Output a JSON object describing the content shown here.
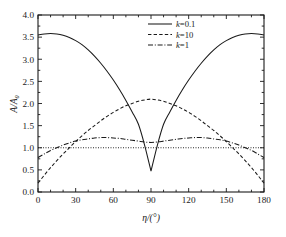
{
  "chart_data": {
    "type": "line",
    "title": "",
    "xlabel": "η/(°)",
    "ylabel": "A/A₀",
    "xlim": [
      0,
      180
    ],
    "ylim": [
      0,
      4
    ],
    "grid": false,
    "legend_position": "top-center",
    "x_ticks": [
      "0",
      "30",
      "60",
      "90",
      "120",
      "150",
      "180"
    ],
    "x_tick_values": [
      0,
      30,
      60,
      90,
      120,
      150,
      180
    ],
    "y_ticks": [
      "0.0",
      "0.5",
      "1.0",
      "1.5",
      "2.0",
      "2.5",
      "3.0",
      "3.5",
      "4.0"
    ],
    "y_tick_values": [
      0.0,
      0.5,
      1.0,
      1.5,
      2.0,
      2.5,
      3.0,
      3.5,
      4.0
    ],
    "x": [
      0,
      5,
      10,
      15,
      20,
      25,
      30,
      35,
      40,
      45,
      50,
      55,
      60,
      65,
      70,
      75,
      80,
      85,
      90,
      95,
      100,
      105,
      110,
      115,
      120,
      125,
      130,
      135,
      140,
      145,
      150,
      155,
      160,
      165,
      170,
      175,
      180
    ],
    "series": [
      {
        "name": "k=0.1",
        "k_value": 0.1,
        "style": "solid",
        "values": [
          3.55,
          3.57,
          3.58,
          3.57,
          3.54,
          3.49,
          3.42,
          3.33,
          3.21,
          3.07,
          2.91,
          2.73,
          2.53,
          2.31,
          2.07,
          1.81,
          1.53,
          1.05,
          0.47,
          1.05,
          1.53,
          1.81,
          2.07,
          2.31,
          2.53,
          2.73,
          2.91,
          3.07,
          3.21,
          3.33,
          3.42,
          3.49,
          3.54,
          3.57,
          3.58,
          3.57,
          3.55
        ]
      },
      {
        "name": "k=10",
        "k_value": 10,
        "style": "dashed",
        "values": [
          0.2,
          0.38,
          0.55,
          0.71,
          0.86,
          1.0,
          1.14,
          1.27,
          1.39,
          1.5,
          1.61,
          1.71,
          1.8,
          1.88,
          1.95,
          2.0,
          2.05,
          2.08,
          2.1,
          2.08,
          2.05,
          2.0,
          1.95,
          1.88,
          1.8,
          1.71,
          1.61,
          1.5,
          1.39,
          1.27,
          1.14,
          1.0,
          0.86,
          0.71,
          0.55,
          0.38,
          0.2
        ]
      },
      {
        "name": "k=1",
        "k_value": 1,
        "style": "dashdot",
        "values": [
          0.78,
          0.86,
          0.94,
          1.0,
          1.06,
          1.11,
          1.15,
          1.18,
          1.2,
          1.22,
          1.23,
          1.23,
          1.22,
          1.21,
          1.19,
          1.17,
          1.15,
          1.13,
          1.12,
          1.13,
          1.15,
          1.17,
          1.19,
          1.21,
          1.22,
          1.23,
          1.23,
          1.22,
          1.2,
          1.18,
          1.15,
          1.11,
          1.06,
          1.0,
          0.94,
          0.86,
          0.78
        ]
      },
      {
        "name": "reference",
        "style": "dotted",
        "constant": 1.0,
        "values": [
          1,
          1,
          1,
          1,
          1,
          1,
          1,
          1,
          1,
          1,
          1,
          1,
          1,
          1,
          1,
          1,
          1,
          1,
          1,
          1,
          1,
          1,
          1,
          1,
          1,
          1,
          1,
          1,
          1,
          1,
          1,
          1,
          1,
          1,
          1,
          1,
          1
        ]
      }
    ],
    "legend": [
      {
        "label_italic": "k",
        "label_rest": "=0.1",
        "style": "solid"
      },
      {
        "label_italic": "k",
        "label_rest": "=10",
        "style": "dashed"
      },
      {
        "label_italic": "k",
        "label_rest": "=1",
        "style": "dashdot"
      }
    ]
  }
}
